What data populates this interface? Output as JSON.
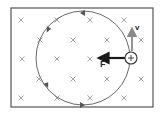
{
  "diagram": {
    "type": "charged-particle-circular-motion-in-magnetic-field",
    "field": {
      "symbol": "×",
      "direction": "into-page",
      "color": "#9a9a9a",
      "marks": [
        {
          "x": 21,
          "y": 20
        },
        {
          "x": 57,
          "y": 20
        },
        {
          "x": 90,
          "y": 20
        },
        {
          "x": 124,
          "y": 20
        },
        {
          "x": 40,
          "y": 40
        },
        {
          "x": 73,
          "y": 40
        },
        {
          "x": 107,
          "y": 40
        },
        {
          "x": 141,
          "y": 40
        },
        {
          "x": 22,
          "y": 59
        },
        {
          "x": 57,
          "y": 59
        },
        {
          "x": 90,
          "y": 59
        },
        {
          "x": 39,
          "y": 79
        },
        {
          "x": 73,
          "y": 79
        },
        {
          "x": 107,
          "y": 79
        },
        {
          "x": 141,
          "y": 79
        },
        {
          "x": 21,
          "y": 98
        },
        {
          "x": 57,
          "y": 98
        },
        {
          "x": 90,
          "y": 98
        },
        {
          "x": 124,
          "y": 98
        }
      ]
    },
    "frame": {
      "x": 11,
      "y": 8,
      "width": 142,
      "height": 99,
      "color": "#555555"
    },
    "orbit": {
      "cx": 83,
      "cy": 58,
      "r": 47,
      "color": "#6a6a6a",
      "direction": "counter-clockwise"
    },
    "particle": {
      "cx": 131,
      "cy": 58,
      "r": 6,
      "charge_symbol": "+"
    },
    "velocity": {
      "label": "v",
      "direction": "up",
      "color": "#8a8a8a"
    },
    "force": {
      "label": "F",
      "direction": "left",
      "color": "#1a1a1a"
    }
  }
}
